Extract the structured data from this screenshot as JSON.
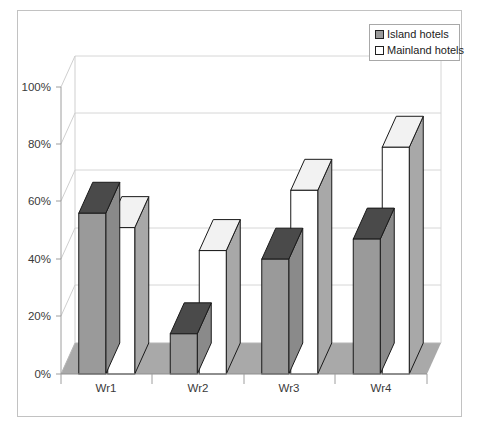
{
  "chart_data": {
    "type": "bar",
    "title": "",
    "subtitle": "",
    "xlabel": "",
    "ylabel": "",
    "categories": [
      "Wr1",
      "Wr2",
      "Wr3",
      "Wr4"
    ],
    "series": [
      {
        "name": "Island hotels",
        "values": [
          56,
          14,
          40,
          47
        ],
        "color": "#999999"
      },
      {
        "name": "Mainland hotels",
        "values": [
          51,
          43,
          64,
          79
        ],
        "color": "#ffffff"
      }
    ],
    "ylim": [
      0,
      100
    ],
    "yticks": [
      0,
      20,
      40,
      60,
      80,
      100
    ],
    "ytick_labels": [
      "0%",
      "20%",
      "40%",
      "60%",
      "80%",
      "100%"
    ],
    "grid": true,
    "grid_axis": "y",
    "legend_position": "top-right",
    "style": "3d-perspective-column",
    "annotations": []
  },
  "legend": {
    "entries": [
      {
        "label": "Island hotels",
        "swatch": "gray-swatch"
      },
      {
        "label": "Mainland hotels",
        "swatch": "white-swatch"
      }
    ]
  },
  "axes": {
    "y": {
      "ticks": [
        "100%",
        "80%",
        "60%",
        "40%",
        "20%",
        "0%"
      ]
    },
    "x": {
      "ticks": [
        "Wr1",
        "Wr2",
        "Wr3",
        "Wr4"
      ]
    }
  },
  "colors": {
    "bar_island_front": "#9a9a9a",
    "bar_island_side": "#8a8a8a",
    "bar_island_top": "#4a4a4a",
    "bar_mainland_front": "#ffffff",
    "bar_mainland_side": "#a8a8a8",
    "bar_mainland_top": "#f2f2f2",
    "floor": "#a9a9a9",
    "wall": "#ffffff",
    "gridline": "#d0d0d0",
    "outline": "#1a1a1a",
    "border": "#bdbdbd"
  }
}
